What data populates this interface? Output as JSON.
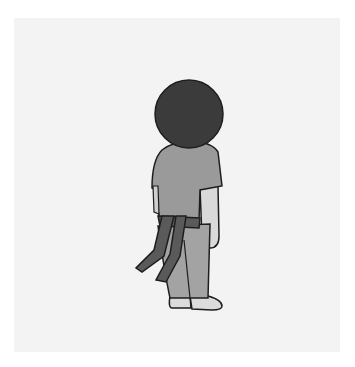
{
  "illustration": {
    "subject": "figure viewed from behind wearing martial arts belt",
    "colors": {
      "background": "#ffffff",
      "card": "#f3f3f3",
      "outline": "#1e1e1e",
      "head": "#3b3b3b",
      "shirt": "#9a9a9a",
      "skin": "#d9d9d9",
      "belt": "#5a5a5a",
      "pants": "#a3a3a3",
      "shoes": "#dcdcdc"
    }
  }
}
